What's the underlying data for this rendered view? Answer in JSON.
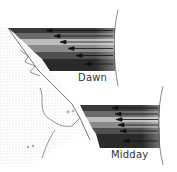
{
  "diagram": {
    "labels": {
      "dawn": "Dawn",
      "midday": "Midday"
    },
    "panels": [
      {
        "id": "dawn",
        "band_colors": [
          "#3a3a3a",
          "#6a6a6a",
          "#bdbdbd",
          "#8a8a8a",
          "#4f4f4f",
          "#2a2a2a"
        ]
      },
      {
        "id": "midday",
        "band_colors": [
          "#3a3a3a",
          "#6a6a6a",
          "#bdbdbd",
          "#8a8a8a",
          "#4f4f4f",
          "#2a2a2a"
        ]
      }
    ],
    "colors": {
      "earth_outline": "#555555",
      "land_stipple": "#bbbbbb",
      "arrow": "#111111"
    }
  }
}
